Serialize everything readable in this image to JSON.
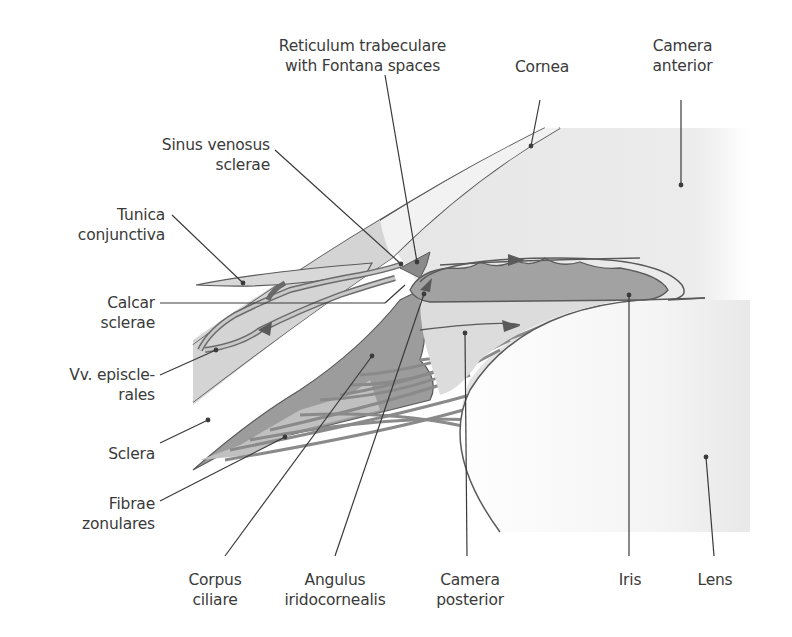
{
  "diagram": {
    "type": "anatomical-cross-section",
    "colors": {
      "background": "#ffffff",
      "sclera_fill": "#d2d2d2",
      "lens_area_fill": "#ededed",
      "ciliary_body_fill": "#9c9c9c",
      "iris_fill": "#a2a2a2",
      "outline": "#5a5a5a",
      "leader_line": "#3a3a3a",
      "text": "#3a3a3a"
    },
    "labels": {
      "reticulum": "Reticulum trabeculare\nwith Fontana spaces",
      "cornea": "Cornea",
      "camera_anterior": "Camera\nanterior",
      "sinus": "Sinus venosus\nsclerae",
      "tunica": "Tunica\nconjunctiva",
      "calcar": "Calcar\nsclerae",
      "vv_episclerales": "Vv. episcle-\nrales",
      "sclera": "Sclera",
      "fibrae": "Fibrae\nzonulares",
      "corpus": "Corpus\nciliare",
      "angulus": "Angulus\niridocornealis",
      "camera_posterior": "Camera\nposterior",
      "iris": "Iris",
      "lens": "Lens"
    }
  }
}
